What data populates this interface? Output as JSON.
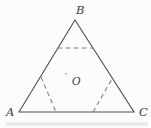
{
  "figure": {
    "background": "#fcfcfb",
    "line_color": "#4f4f4f",
    "dash_color": "#818181",
    "label_color": "#3d3d3d",
    "triangle": {
      "points": "19,112 75,20 134,112",
      "vertices": {
        "A": "19,112",
        "B": "75,20",
        "C": "134,112"
      }
    },
    "dashed_segments": [
      {
        "name": "near-B-horizontal",
        "x1": 58,
        "y1": 48,
        "x2": 93,
        "y2": 48
      },
      {
        "name": "near-A-slanted",
        "x1": 41,
        "y1": 77,
        "x2": 56,
        "y2": 112
      },
      {
        "name": "near-C-slanted",
        "x1": 93,
        "y1": 112,
        "x2": 112,
        "y2": 79
      }
    ],
    "labels": {
      "A": {
        "text": "A",
        "x": 6,
        "y": 116
      },
      "B": {
        "text": "B",
        "x": 76,
        "y": 14
      },
      "C": {
        "text": "C",
        "x": 139,
        "y": 116
      },
      "O": {
        "text": "O",
        "x": 72,
        "y": 85,
        "marker": "″",
        "marker_x": 65,
        "marker_y": 78
      }
    },
    "artifact_bar": {
      "x": 6,
      "y": 122.5,
      "width": 142,
      "height": 3.2,
      "color": "#e1e1df"
    }
  }
}
